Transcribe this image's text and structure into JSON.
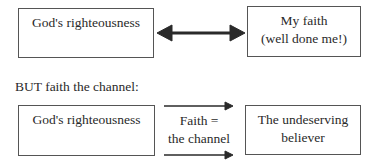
{
  "top_row": {
    "left_box": {
      "lines": [
        "God's righteousness"
      ]
    },
    "right_box": {
      "lines": [
        "My faith",
        "(well done me!)"
      ]
    },
    "connector": "double-headed-arrow"
  },
  "caption": "BUT faith the channel:",
  "bottom_row": {
    "left_box": {
      "lines": [
        "God's righteousness"
      ]
    },
    "middle_label": {
      "lines": [
        "Faith =",
        "the channel"
      ]
    },
    "right_box": {
      "lines": [
        "The undeserving",
        "believer"
      ]
    },
    "connector": "two-right-arrows"
  },
  "colors": {
    "border": "#555555",
    "arrow": "#2a2a2a",
    "text": "#2a2a2a"
  }
}
